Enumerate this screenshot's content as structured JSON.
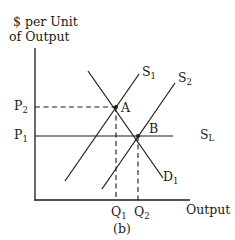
{
  "diagram": {
    "caption": "(b)",
    "y_axis_title_line1": "$ per Unit",
    "y_axis_title_line2": "of Output",
    "x_axis_title": "Output",
    "price_labels": [
      {
        "base": "P",
        "sub": "2"
      },
      {
        "base": "P",
        "sub": "1"
      }
    ],
    "quantity_labels": [
      {
        "base": "Q",
        "sub": "1"
      },
      {
        "base": "Q",
        "sub": "2"
      }
    ],
    "curves": [
      {
        "base": "S",
        "sub": "1",
        "role": "short-run supply 1"
      },
      {
        "base": "S",
        "sub": "2",
        "role": "short-run supply 2"
      },
      {
        "base": "S",
        "sub": "L",
        "role": "long-run supply (horizontal)"
      },
      {
        "base": "D",
        "sub": "1",
        "role": "demand"
      }
    ],
    "points": [
      {
        "label": "A",
        "desc": "intersection of S1 and D1 at (Q1, P2)"
      },
      {
        "label": "B",
        "desc": "intersection of S2, D1 and SL at (Q2, P1)"
      }
    ],
    "colors": {
      "ink": "#1a1a1a",
      "background": "#ffffff"
    }
  }
}
